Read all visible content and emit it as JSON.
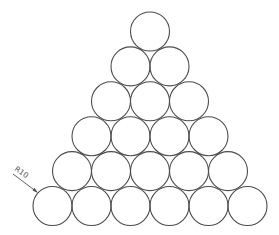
{
  "diagram": {
    "type": "circle-packing-triangle",
    "rows": 6,
    "circles_per_row": [
      1,
      2,
      3,
      4,
      5,
      6
    ],
    "radius_px": 19.5,
    "spacing_px": 39,
    "row_spacing_px": 34.9,
    "apex_center": [
      150,
      31.5
    ],
    "stroke_color": "#4d4d4d",
    "background": "#ffffff"
  },
  "annotation": {
    "label": "R10",
    "leader_start": [
      13,
      174
    ],
    "arrow_tip": [
      38,
      193
    ],
    "text_rotation_deg": 35
  }
}
